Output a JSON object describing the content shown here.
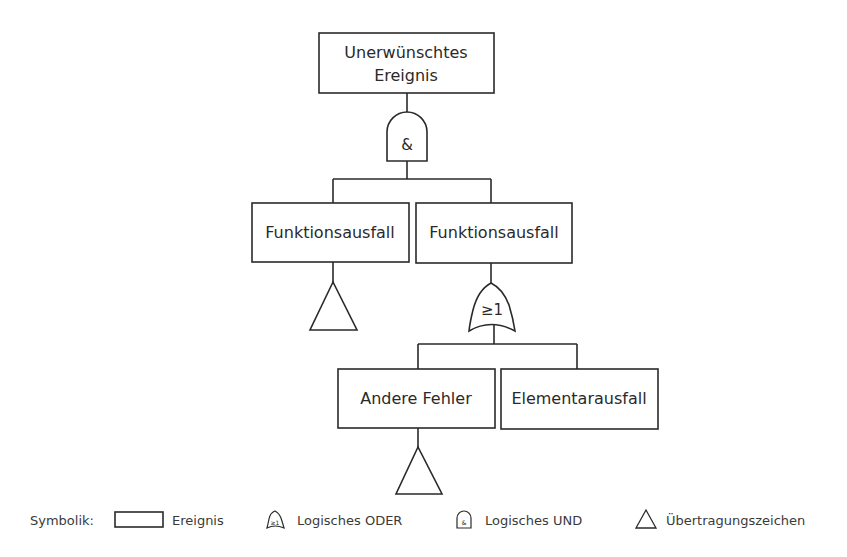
{
  "diagram": {
    "events": {
      "top": {
        "line1": "Unerwünschtes",
        "line2": "Ereignis"
      },
      "left_mid": "Funktionsausfall",
      "right_mid": "Funktionsausfall",
      "bottom_left": "Andere Fehler",
      "bottom_right": "Elementarausfall"
    },
    "gates": {
      "and_gate": "&",
      "or_gate": "≥1"
    }
  },
  "legend": {
    "title": "Symbolik:",
    "items": [
      {
        "icon": "event-rectangle-icon",
        "label": "Ereignis"
      },
      {
        "icon": "or-gate-icon",
        "mini": "≥1",
        "label": "Logisches ODER"
      },
      {
        "icon": "and-gate-icon",
        "mini": "&",
        "label": "Logisches UND"
      },
      {
        "icon": "transfer-triangle-icon",
        "label": "Übertragungszeichen"
      }
    ]
  }
}
